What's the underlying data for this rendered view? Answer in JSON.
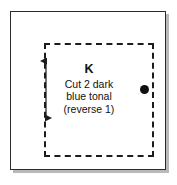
{
  "diagram": {
    "kind": "sewing-pattern-piece",
    "outer_frame": {
      "shape": "rectangle",
      "line_style": "solid",
      "color": "#2b2b2b",
      "shadow_color": "#b9b9b9"
    },
    "cut_line": {
      "shape": "rectangle",
      "line_style": "dashed",
      "color": "#1c1c1c"
    },
    "grain_line": {
      "icon": "double-headed-vertical-arrow",
      "orientation": "vertical",
      "color": "#1c1c1c"
    },
    "match_dot": {
      "icon": "filled-circle-dot",
      "color": "#101010",
      "position": "right-seam"
    },
    "label": {
      "piece_letter": "K",
      "description_lines": [
        "Cut 2 dark",
        "blue tonal",
        "(reverse 1)"
      ]
    }
  }
}
